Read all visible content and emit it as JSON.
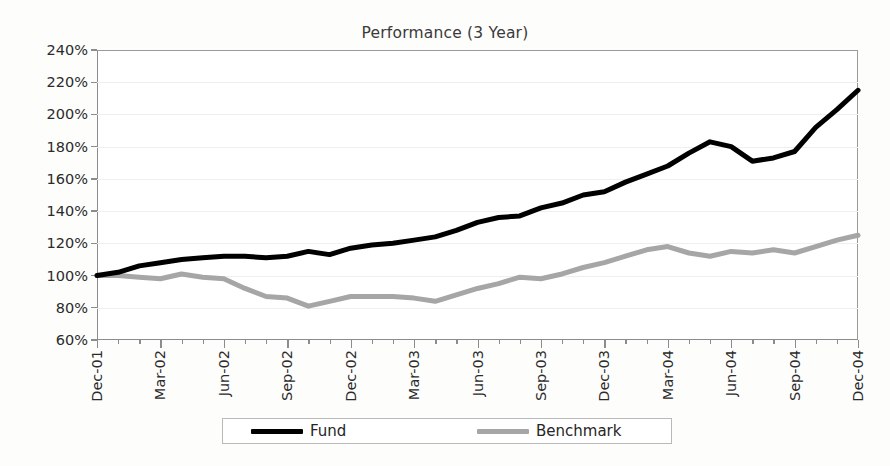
{
  "chart": {
    "title": "Performance (3 Year)",
    "background": "#ffffff"
  },
  "legend": {
    "position": "bottom",
    "entries": [
      {
        "label": "Fund",
        "color": "#000000"
      },
      {
        "label": "Benchmark",
        "color": "#a6a6a6"
      }
    ]
  },
  "axes": {
    "y": {
      "ticks": [
        "60%",
        "80%",
        "100%",
        "120%",
        "140%",
        "160%",
        "180%",
        "200%",
        "220%",
        "240%"
      ],
      "min": 60,
      "max": 240,
      "step": 20,
      "grid": true
    },
    "x": {
      "ticks": [
        "Dec-01",
        "Mar-02",
        "Jun-02",
        "Sep-02",
        "Dec-02",
        "Mar-03",
        "Jun-03",
        "Sep-03",
        "Dec-03",
        "Mar-04",
        "Jun-04",
        "Sep-04",
        "Dec-04"
      ],
      "interval": "monthly",
      "grid": false
    }
  },
  "chart_data": {
    "type": "line",
    "title": "Performance (3 Year)",
    "xlabel": "",
    "ylabel": "",
    "ylim": [
      60,
      240
    ],
    "ytick_labels": [
      "60%",
      "80%",
      "100%",
      "120%",
      "140%",
      "160%",
      "180%",
      "200%",
      "220%",
      "240%"
    ],
    "x": [
      "Dec-01",
      "Jan-02",
      "Feb-02",
      "Mar-02",
      "Apr-02",
      "May-02",
      "Jun-02",
      "Jul-02",
      "Aug-02",
      "Sep-02",
      "Oct-02",
      "Nov-02",
      "Dec-02",
      "Jan-03",
      "Feb-03",
      "Mar-03",
      "Apr-03",
      "May-03",
      "Jun-03",
      "Jul-03",
      "Aug-03",
      "Sep-03",
      "Oct-03",
      "Nov-03",
      "Dec-03",
      "Jan-04",
      "Feb-04",
      "Mar-04",
      "Apr-04",
      "May-04",
      "Jun-04",
      "Jul-04",
      "Aug-04",
      "Sep-04",
      "Oct-04",
      "Nov-04",
      "Dec-04"
    ],
    "x_major_ticks": [
      "Dec-01",
      "Mar-02",
      "Jun-02",
      "Sep-02",
      "Dec-02",
      "Mar-03",
      "Jun-03",
      "Sep-03",
      "Dec-03",
      "Mar-04",
      "Jun-04",
      "Sep-04",
      "Dec-04"
    ],
    "legend_position": "bottom",
    "grid": true,
    "series": [
      {
        "name": "Fund",
        "color": "#000000",
        "width": 5,
        "values": [
          100,
          102,
          106,
          108,
          110,
          111,
          112,
          112,
          111,
          112,
          115,
          113,
          117,
          119,
          120,
          122,
          124,
          128,
          133,
          136,
          137,
          142,
          145,
          150,
          152,
          158,
          163,
          168,
          176,
          183,
          180,
          171,
          173,
          177,
          178,
          177,
          186
        ]
      },
      {
        "name": "Benchmark",
        "color": "#a6a6a6",
        "width": 5,
        "values": [
          100,
          100,
          99,
          98,
          101,
          99,
          98,
          92,
          87,
          86,
          81,
          84,
          87,
          87,
          87,
          86,
          84,
          88,
          92,
          95,
          99,
          98,
          101,
          105,
          108,
          112,
          116,
          118,
          114,
          112,
          115,
          114,
          116,
          114,
          118,
          122,
          124
        ]
      }
    ],
    "series_tail": {
      "note": "Fund continues 192, 203, 215 for Oct-04..Dec-04",
      "fund_end": 215,
      "benchmark_end": 125
    }
  }
}
